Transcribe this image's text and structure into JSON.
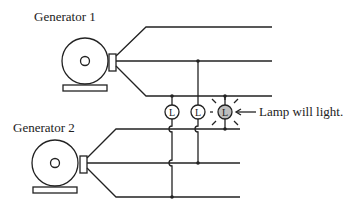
{
  "diagram": {
    "type": "generator-synchronization",
    "generators": [
      {
        "label": "Generator 1"
      },
      {
        "label": "Generator 2"
      }
    ],
    "lamps": [
      {
        "letter": "L",
        "lit": false
      },
      {
        "letter": "L",
        "lit": false
      },
      {
        "letter": "L",
        "lit": true
      }
    ],
    "annotation": "Lamp will light.",
    "colors": {
      "line": "#222222",
      "lit_lamp_fill": "#bdbdbd",
      "background": "#ffffff"
    }
  }
}
